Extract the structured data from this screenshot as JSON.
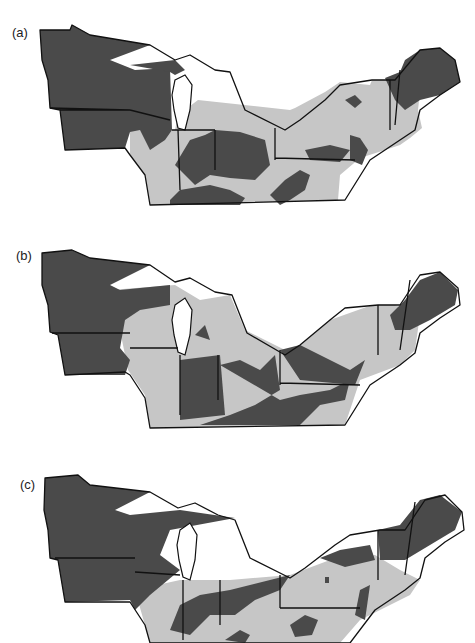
{
  "figure": {
    "region": "Upper Midwest and Northeastern United States",
    "legend_colors": {
      "category_dark": "#4a4a4a",
      "category_light": "#c6c6c6",
      "water_background": "#ffffff"
    },
    "panels": [
      {
        "label": "(a)",
        "top": 0
      },
      {
        "label": "(b)",
        "top": 220
      },
      {
        "label": "(c)",
        "top": 440
      }
    ]
  }
}
